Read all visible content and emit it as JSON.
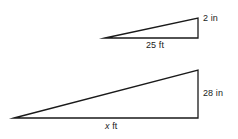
{
  "figure": {
    "name": "similar-triangles-proportion-figure",
    "background_color": "#ffffff",
    "stroke_color": "#1a1a1a",
    "text_color": "#1a1a1a",
    "small_triangle": {
      "name": "small-right-triangle",
      "height_label": "2 in",
      "base_label": "25 ft",
      "height_value": 2,
      "height_unit": "in",
      "base_value": 25,
      "base_unit": "ft",
      "apex": [
        105,
        38
      ],
      "top_right": [
        198,
        18
      ],
      "bottom_right": [
        198,
        38
      ]
    },
    "large_triangle": {
      "name": "large-right-triangle",
      "height_label": "28 in",
      "base_label_variable": "x",
      "base_label_unit": "ft",
      "height_value": 28,
      "height_unit": "in",
      "base_unit": "ft",
      "apex": [
        14,
        118
      ],
      "top_right": [
        198,
        70
      ],
      "bottom_right": [
        198,
        118
      ]
    }
  }
}
